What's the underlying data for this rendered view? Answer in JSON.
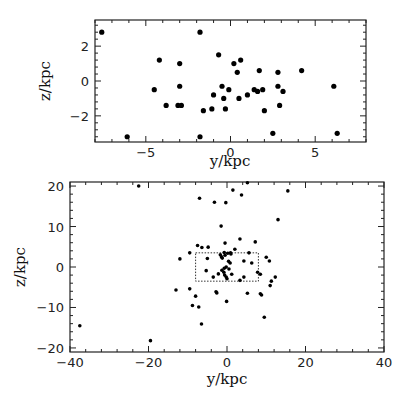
{
  "chart_data": [
    {
      "type": "scatter",
      "title": "",
      "xlabel": "y/kpc",
      "ylabel": "z/kpc",
      "xlim": [
        -8,
        8
      ],
      "ylim": [
        -3.5,
        3.5
      ],
      "xticks": [
        -5,
        0,
        5
      ],
      "yticks": [
        -2,
        0,
        2
      ],
      "grid": false,
      "legend": null,
      "marker_radius": 2.6,
      "frame": {
        "left": 95,
        "right": 366,
        "top": 20,
        "bottom": 142
      },
      "points": [
        [
          -7.6,
          2.8
        ],
        [
          -1.8,
          2.8
        ],
        [
          -6.1,
          -3.2
        ],
        [
          -1.8,
          -3.2
        ],
        [
          -4.2,
          1.2
        ],
        [
          -3.0,
          1.0
        ],
        [
          -4.5,
          -0.5
        ],
        [
          -3.0,
          -0.3
        ],
        [
          -3.8,
          -1.4
        ],
        [
          -3.1,
          -1.4
        ],
        [
          -2.9,
          -1.4
        ],
        [
          -1.6,
          -1.7
        ],
        [
          -1.1,
          -1.6
        ],
        [
          -0.7,
          1.5
        ],
        [
          -1.0,
          -0.8
        ],
        [
          -0.5,
          -0.3
        ],
        [
          -0.4,
          -1.0
        ],
        [
          -0.3,
          -1.6
        ],
        [
          -0.1,
          -0.5
        ],
        [
          0.2,
          1.0
        ],
        [
          0.6,
          1.2
        ],
        [
          0.4,
          0.5
        ],
        [
          0.5,
          -1.0
        ],
        [
          1.0,
          -0.8
        ],
        [
          1.4,
          -0.5
        ],
        [
          1.6,
          -0.6
        ],
        [
          1.7,
          0.6
        ],
        [
          1.9,
          -0.5
        ],
        [
          2.0,
          -1.7
        ],
        [
          2.5,
          -3.0
        ],
        [
          2.8,
          0.5
        ],
        [
          2.8,
          -0.3
        ],
        [
          2.9,
          -1.4
        ],
        [
          3.1,
          -0.6
        ],
        [
          4.2,
          0.6
        ],
        [
          6.1,
          -0.3
        ],
        [
          6.3,
          -3.0
        ]
      ]
    },
    {
      "type": "scatter",
      "title": "",
      "xlabel": "y/kpc",
      "ylabel": "z/kpc",
      "xlim": [
        -40,
        40
      ],
      "ylim": [
        -21,
        21
      ],
      "xticks": [
        -40,
        -20,
        0,
        20,
        40
      ],
      "yticks": [
        -20,
        -10,
        0,
        10,
        20
      ],
      "grid": false,
      "legend": null,
      "marker_radius": 1.8,
      "frame": {
        "left": 70,
        "right": 384,
        "top": 182,
        "bottom": 352
      },
      "inset_box": {
        "x": [
          -8,
          8
        ],
        "y": [
          -3.5,
          3.5
        ],
        "style": "dotted"
      },
      "points": [
        [
          -22.5,
          20.0
        ],
        [
          5.2,
          20.8
        ],
        [
          1.5,
          19.0
        ],
        [
          15.5,
          18.8
        ],
        [
          3.7,
          17.8
        ],
        [
          -7.0,
          17.0
        ],
        [
          -3.2,
          16.0
        ],
        [
          -0.3,
          15.9
        ],
        [
          13.0,
          11.7
        ],
        [
          -1.5,
          10.1
        ],
        [
          3.3,
          6.9
        ],
        [
          7.2,
          6.2
        ],
        [
          -0.5,
          5.9
        ],
        [
          -7.5,
          5.3
        ],
        [
          -6.4,
          4.8
        ],
        [
          -4.8,
          4.9
        ],
        [
          2.0,
          4.4
        ],
        [
          -9.5,
          3.5
        ],
        [
          5.6,
          3.5
        ],
        [
          -0.7,
          3.6
        ],
        [
          0.2,
          3.4
        ],
        [
          0.9,
          3.5
        ],
        [
          1.0,
          3.2
        ],
        [
          -1.7,
          3.0
        ],
        [
          -1.4,
          2.5
        ],
        [
          -0.5,
          2.9
        ],
        [
          -1.2,
          2.2
        ],
        [
          10.0,
          2.4
        ],
        [
          -12.0,
          2.0
        ],
        [
          -5.0,
          2.1
        ],
        [
          0.4,
          1.4
        ],
        [
          0.8,
          1.0
        ],
        [
          4.3,
          1.5
        ],
        [
          10.8,
          1.5
        ],
        [
          6.3,
          1.0
        ],
        [
          -0.2,
          0.0
        ],
        [
          -0.7,
          -0.3
        ],
        [
          -1.3,
          -0.8
        ],
        [
          0.5,
          -0.5
        ],
        [
          -5.3,
          -0.9
        ],
        [
          -0.8,
          -1.3
        ],
        [
          7.8,
          -1.3
        ],
        [
          -2.2,
          -1.7
        ],
        [
          1.2,
          -1.8
        ],
        [
          8.5,
          -1.8
        ],
        [
          -0.6,
          -2.0
        ],
        [
          -3.5,
          -2.5
        ],
        [
          4.3,
          -2.5
        ],
        [
          -0.2,
          -2.5
        ],
        [
          12.3,
          -2.5
        ],
        [
          0.0,
          -2.9
        ],
        [
          3.3,
          -3.3
        ],
        [
          11.3,
          -3.5
        ],
        [
          11.0,
          -4.6
        ],
        [
          -13.0,
          -5.7
        ],
        [
          -9.5,
          -5.4
        ],
        [
          -2.8,
          -6.1
        ],
        [
          -2.6,
          -6.4
        ],
        [
          5.2,
          -6.5
        ],
        [
          8.5,
          -6.6
        ],
        [
          8.8,
          -6.9
        ],
        [
          -8.0,
          -7.2
        ],
        [
          -0.1,
          -8.5
        ],
        [
          -8.8,
          -9.5
        ],
        [
          -7.2,
          -9.9
        ],
        [
          9.5,
          -12.4
        ],
        [
          -6.5,
          -14.1
        ],
        [
          -37.5,
          -14.5
        ],
        [
          -19.5,
          -18.2
        ]
      ]
    }
  ],
  "panels": [
    {
      "xlabel": "y/kpc",
      "ylabel": "z/kpc"
    },
    {
      "xlabel": "y/kpc",
      "ylabel": "z/kpc"
    }
  ]
}
